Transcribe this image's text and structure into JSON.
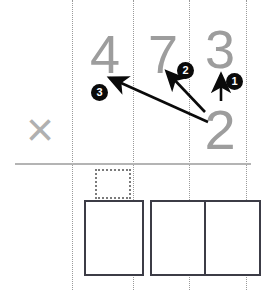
{
  "worksheet": {
    "title": "Long multiplication carry diagram",
    "operator_symbol": "×",
    "multiplicand": {
      "digits": [
        "4",
        "7",
        "3"
      ]
    },
    "multiplier": {
      "digits": [
        "2"
      ]
    },
    "steps": [
      {
        "label": "1",
        "description": "multiply 2 by 3 (ones column)"
      },
      {
        "label": "2",
        "description": "multiply 2 by 7 (tens column)"
      },
      {
        "label": "3",
        "description": "multiply 2 by 4 (hundreds column)"
      }
    ],
    "carry_box": {
      "value": "",
      "placeholder": "carry"
    },
    "answer_boxes": [
      {
        "value": "",
        "placeholder": "hundreds"
      },
      {
        "value": "",
        "placeholder": "tens"
      },
      {
        "value": "",
        "placeholder": "ones"
      }
    ],
    "colors": {
      "digit_gray": "#9d9d9d",
      "operator_gray": "#b0b0b0",
      "rule_gray": "#b4b4b4",
      "column_line_gray": "#9a9a9a",
      "arrow_black": "#0a0a0a",
      "badge_black": "#0a0a0a",
      "badge_text": "#ffffff",
      "box_border": "#3c3c46",
      "carry_box_border": "#7b7b7b",
      "background": "#ffffff"
    }
  }
}
